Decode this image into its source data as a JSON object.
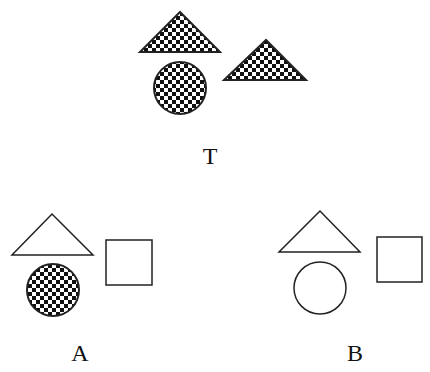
{
  "figures": {
    "target": {
      "label": "T",
      "shapes": [
        "checkered triangle",
        "checkered circle",
        "checkered triangle"
      ]
    },
    "option_a": {
      "label": "A",
      "shapes": [
        "outline triangle",
        "checkered circle",
        "outline square"
      ]
    },
    "option_b": {
      "label": "B",
      "shapes": [
        "outline triangle",
        "outline circle",
        "outline square"
      ]
    }
  },
  "colors": {
    "stroke": "#222222",
    "fill_dark": "#111111",
    "fill_light": "#ffffff"
  }
}
